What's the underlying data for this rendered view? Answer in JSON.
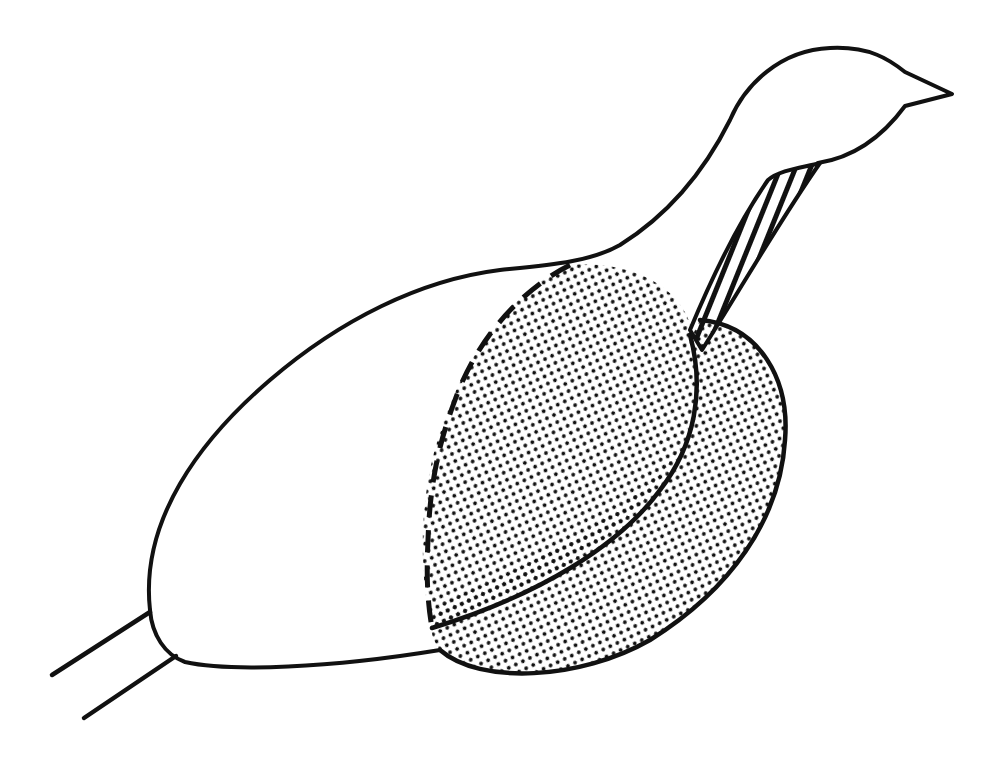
{
  "figure": {
    "background": "#ffffff",
    "line_color": "#111111",
    "regions": [
      {
        "name": "body",
        "fill": "none",
        "outline": "solid"
      },
      {
        "name": "head-and-neck",
        "fill": "none",
        "outline": "solid"
      },
      {
        "name": "forward-stippled-region",
        "fill": "stipple",
        "outline": "dashed"
      },
      {
        "name": "lower-stippled-region",
        "fill": "stipple",
        "outline": "solid"
      },
      {
        "name": "neck-hatched-band",
        "fill": "diagonal-hatch",
        "outline": "solid"
      },
      {
        "name": "legs",
        "fill": "none",
        "outline": "solid"
      }
    ]
  }
}
